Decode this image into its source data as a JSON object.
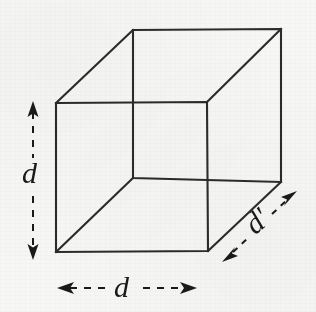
{
  "figure": {
    "type": "geometric-line-diagram",
    "background_color": "#f7f7f5",
    "stroke_color": "#2b2b2b",
    "canvas": {
      "width": 316,
      "height": 312
    }
  },
  "shape": {
    "name": "cube",
    "projection": "oblique-cabinet",
    "depth_offset": {
      "dx": 77,
      "dy": -73
    },
    "front_face_vertices": [
      {
        "name": "front-top-left",
        "x": 56,
        "y": 103
      },
      {
        "name": "front-top-right",
        "x": 207,
        "y": 102
      },
      {
        "name": "front-bottom-right",
        "x": 208,
        "y": 251
      },
      {
        "name": "front-bottom-left",
        "x": 56,
        "y": 252
      }
    ],
    "back_face_vertices": [
      {
        "name": "back-top-left",
        "x": 133,
        "y": 30
      },
      {
        "name": "back-top-right",
        "x": 281,
        "y": 29
      },
      {
        "name": "back-bottom-right",
        "x": 281,
        "y": 182
      },
      {
        "name": "back-bottom-left",
        "x": 133,
        "y": 178
      }
    ]
  },
  "annotations": {
    "height": {
      "label": "d",
      "icon": "double-headed-arrow-vertical",
      "orientation": "vertical",
      "shaft_style": "dashed",
      "arrow_from": {
        "x": 33,
        "y": 103
      },
      "arrow_to": {
        "x": 33,
        "y": 258
      },
      "measures": "cube-front-left-edge"
    },
    "width": {
      "label": "d",
      "icon": "double-headed-arrow-horizontal",
      "orientation": "horizontal",
      "shaft_style": "dashed",
      "arrow_from": {
        "x": 58,
        "y": 288
      },
      "arrow_to": {
        "x": 196,
        "y": 288
      },
      "measures": "cube-front-bottom-edge"
    },
    "depth": {
      "label": "d′",
      "icon": "double-headed-arrow-diagonal",
      "orientation": "diagonal",
      "shaft_style": "dashed",
      "rotation_deg": -41,
      "arrow_from": {
        "x": 224,
        "y": 260
      },
      "arrow_to": {
        "x": 295,
        "y": 193
      },
      "measures": "cube-depth-edge"
    }
  }
}
